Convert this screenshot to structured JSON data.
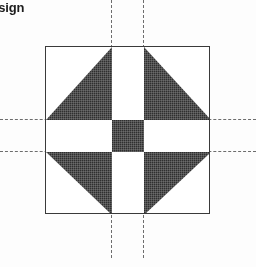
{
  "page": {
    "width": 256,
    "height": 267,
    "background_color": "#fdfdfd"
  },
  "heading": {
    "text": "Design",
    "note_visible_fragment": "esign",
    "color": "#1c1c1c",
    "bold": true
  },
  "diagram": {
    "name": "quilt-block-pattern",
    "outline": {
      "left": 45,
      "top": 46,
      "width": 165,
      "height": 168,
      "stroke_color": "#3a3a3a",
      "stroke_width": 1,
      "fill_color": "#ffffff"
    },
    "colors": {
      "dark_fill": "#2f2f2f",
      "light_fill": "#ffffff",
      "guide_line": "#6d6d6d"
    },
    "grid": {
      "columns": 3,
      "rows": 3,
      "col_widths": [
        66,
        32,
        67
      ],
      "row_heights": [
        73,
        32,
        63
      ]
    },
    "patches": [
      {
        "name": "patch-top-left",
        "row": 0,
        "col": 0,
        "shape": "half-square-triangle",
        "dark_corner": "bottom-right",
        "light_corner": "top-left"
      },
      {
        "name": "patch-top-center",
        "row": 0,
        "col": 1,
        "shape": "rectangle",
        "fill": "light"
      },
      {
        "name": "patch-top-right",
        "row": 0,
        "col": 2,
        "shape": "half-square-triangle",
        "dark_corner": "bottom-left",
        "light_corner": "top-right"
      },
      {
        "name": "patch-middle-left",
        "row": 1,
        "col": 0,
        "shape": "rectangle",
        "fill": "light"
      },
      {
        "name": "patch-center",
        "row": 1,
        "col": 1,
        "shape": "square",
        "fill": "dark"
      },
      {
        "name": "patch-middle-right",
        "row": 1,
        "col": 2,
        "shape": "rectangle",
        "fill": "light"
      },
      {
        "name": "patch-bottom-left",
        "row": 2,
        "col": 0,
        "shape": "half-square-triangle",
        "dark_corner": "top-right",
        "light_corner": "bottom-left"
      },
      {
        "name": "patch-bottom-center",
        "row": 2,
        "col": 1,
        "shape": "rectangle",
        "fill": "light"
      },
      {
        "name": "patch-bottom-right",
        "row": 2,
        "col": 2,
        "shape": "half-square-triangle",
        "dark_corner": "top-left",
        "light_corner": "bottom-right"
      }
    ],
    "guides": [
      {
        "name": "guide-horizontal-upper",
        "orientation": "horizontal",
        "position": 119,
        "style": "dashed"
      },
      {
        "name": "guide-horizontal-lower",
        "orientation": "horizontal",
        "position": 151,
        "style": "dashed"
      },
      {
        "name": "guide-vertical-left",
        "orientation": "vertical",
        "position": 111,
        "style": "dashed",
        "top": 0,
        "length": 258
      },
      {
        "name": "guide-vertical-right",
        "orientation": "vertical",
        "position": 143,
        "style": "dashed",
        "top": 0,
        "length": 258
      }
    ]
  }
}
